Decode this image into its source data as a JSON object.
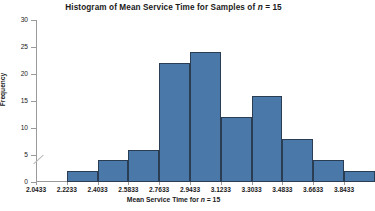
{
  "chart_data": {
    "type": "bar",
    "title": "Histogram of Mean Service Time for Samples of n = 15",
    "title_plain": "Histogram of Mean Service Time for Samples of n = 15",
    "xlabel": "Mean Service Time for n = 15",
    "ylabel": "Frequency",
    "grid": false,
    "legend": "none",
    "ylim": [
      0,
      30
    ],
    "ytick_labels": [
      "0",
      "5",
      "10",
      "15",
      "20",
      "25",
      "30"
    ],
    "ytick_values": [
      0,
      5,
      10,
      15,
      20,
      25,
      30
    ],
    "xtick_labels": [
      "2.0433",
      "2.2233",
      "2.4033",
      "2.5833",
      "2.7633",
      "2.9433",
      "3.1233",
      "3.3033",
      "3.4833",
      "3.6633",
      "3.8433"
    ],
    "xtick_values": [
      2.0433,
      2.2233,
      2.4033,
      2.5833,
      2.7633,
      2.9433,
      3.1233,
      3.3033,
      3.4833,
      3.6633,
      3.8433
    ],
    "bin_width": 0.18,
    "bin_edges": [
      2.2233,
      2.4033,
      2.5833,
      2.7633,
      2.9433,
      3.1233,
      3.3033,
      3.4833,
      3.6633,
      3.8433,
      4.0233
    ],
    "categories": [
      "2.2233-2.4033",
      "2.4033-2.5833",
      "2.5833-2.7633",
      "2.7633-2.9433",
      "2.9433-3.1233",
      "3.1233-3.3033",
      "3.3033-3.4833",
      "3.4833-3.6633",
      "3.6633-3.8433",
      "3.8433-4.0233"
    ],
    "values": [
      2,
      4,
      6,
      22,
      24,
      12,
      16,
      8,
      4,
      2
    ],
    "bar_color": "#4a78a8",
    "bar_edge_color": "#2b3d52",
    "axis_color": "#9a9a9a",
    "axis_break": true
  },
  "annotations": {
    "italic_variable": "n",
    "sample_size": "15"
  }
}
